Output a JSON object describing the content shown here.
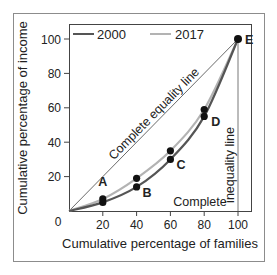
{
  "chart_data": {
    "type": "line",
    "title": "",
    "xlabel": "Cumulative percentage of families",
    "ylabel": "Cumulative percentage of income",
    "xlim": [
      0,
      100
    ],
    "ylim": [
      0,
      100
    ],
    "x_ticks": [
      20,
      40,
      60,
      80,
      100
    ],
    "y_ticks": [
      20,
      40,
      60,
      80,
      100
    ],
    "origin_label": "0",
    "grid": false,
    "legend_position": "top-inside",
    "x": [
      0,
      20,
      40,
      60,
      80,
      100
    ],
    "series": [
      {
        "name": "2000",
        "color": "#555555",
        "values": [
          0,
          5,
          14,
          30,
          55,
          100
        ]
      },
      {
        "name": "2017",
        "color": "#b3b3b3",
        "values": [
          0,
          7,
          19,
          35,
          59,
          100
        ]
      }
    ],
    "points": [
      {
        "label": "A",
        "x": 20,
        "y_2000": 5,
        "y_2017": 7
      },
      {
        "label": "B",
        "x": 40,
        "y_2000": 14,
        "y_2017": 19
      },
      {
        "label": "C",
        "x": 60,
        "y_2000": 30,
        "y_2017": 35
      },
      {
        "label": "D",
        "x": 80,
        "y_2000": 55,
        "y_2017": 59
      },
      {
        "label": "E",
        "x": 100,
        "y": 100
      }
    ],
    "annotations": [
      {
        "text": "Complete equality line",
        "kind": "diagonal"
      },
      {
        "text": "Complete",
        "kind": "horizontal-bottom"
      },
      {
        "text": "inequality line",
        "kind": "vertical-right"
      }
    ]
  }
}
